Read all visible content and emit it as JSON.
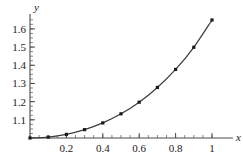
{
  "chart_data": {
    "type": "line",
    "title": "",
    "subtitle": "",
    "xlabel": "x",
    "ylabel": "y",
    "xlim": [
      0,
      1.06
    ],
    "ylim": [
      1.0,
      1.68
    ],
    "grid": false,
    "legend": null,
    "x_major_ticks": [
      0.2,
      0.4,
      0.6,
      0.8,
      1
    ],
    "x_major_tick_labels": [
      "0.2",
      "0.4",
      "0.6",
      "0.8",
      "1"
    ],
    "x_minor_tick_step": 0.05,
    "y_major_ticks": [
      1.1,
      1.2,
      1.3,
      1.4,
      1.5,
      1.6
    ],
    "y_major_tick_labels": [
      "1.1",
      "1.2",
      "1.3",
      "1.4",
      "1.5",
      "1.6"
    ],
    "y_minor_tick_step": 0.025,
    "marker": "square",
    "marker_size": 3.2,
    "line_color": "#3d3d3d",
    "marker_color": "#1a1a1a",
    "axis_color": "#4a4a4a",
    "background": "#ffffff",
    "series": [
      {
        "name": "curve",
        "x": [
          0,
          0.1,
          0.2,
          0.3,
          0.4,
          0.5,
          0.6,
          0.7,
          0.8,
          0.9,
          1
        ],
        "values": [
          1.0,
          1.005,
          1.02,
          1.046,
          1.083,
          1.133,
          1.197,
          1.278,
          1.377,
          1.499,
          1.649
        ]
      }
    ]
  },
  "axes": {
    "x_name": "x",
    "y_name": "y"
  }
}
